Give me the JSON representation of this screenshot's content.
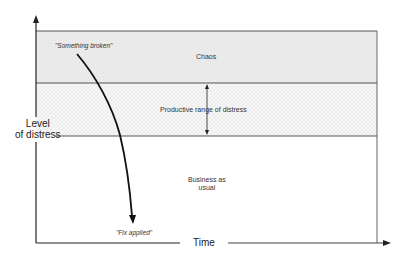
{
  "diagram": {
    "y_axis_label_line1": "Level",
    "y_axis_label_line2": "of distress",
    "x_axis_label": "Time",
    "zones": {
      "chaos": "Chaos",
      "productive": "Productive range of distress",
      "business_line1": "Business as",
      "business_line2": "usual"
    },
    "annotations": {
      "start": "\"Something broken\"",
      "end": "\"Fix applied\""
    },
    "colors": {
      "chaos_fill": "#ececec",
      "productive_fill": "#f6f6f6",
      "line": "#555555",
      "curve": "#111111"
    }
  }
}
